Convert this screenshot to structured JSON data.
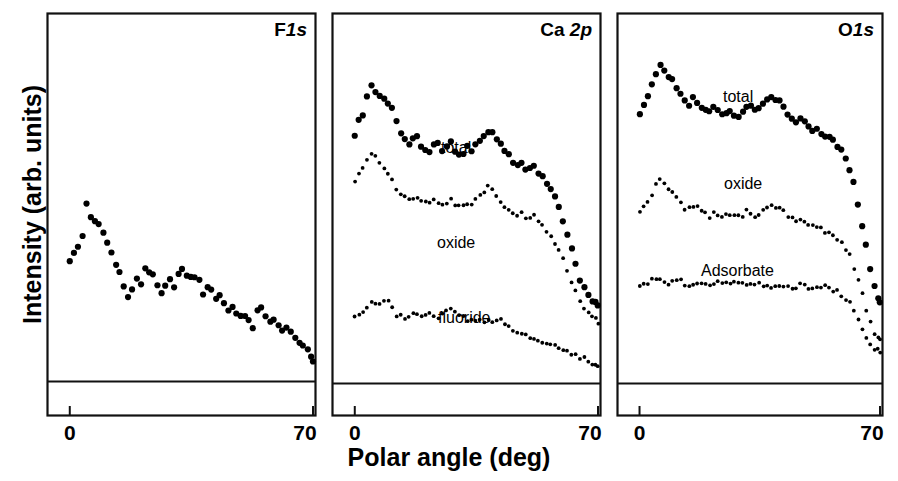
{
  "figure": {
    "xlabel": "Polar angle (deg)",
    "ylabel": "Intensity (arb. units)",
    "tick_left": "0",
    "tick_right": "70"
  },
  "panels": [
    {
      "id": "f1s",
      "title_main": "F",
      "title_ital": "1s",
      "series_labels": []
    },
    {
      "id": "ca2p",
      "title_main": "Ca ",
      "title_ital": "2p",
      "series_labels": [
        "total",
        "oxide",
        "fluoride"
      ]
    },
    {
      "id": "o1s",
      "title_main": "O",
      "title_ital": "1s",
      "series_labels": [
        "total",
        "oxide",
        "Adsorbate"
      ]
    }
  ],
  "chart_data": {
    "type": "scatter",
    "title": "",
    "xlabel": "Polar angle (deg)",
    "ylabel": "Intensity (arb. units)",
    "xlim": [
      0,
      70
    ],
    "xticks": [
      0,
      70
    ],
    "xticklabels": [
      "0",
      "70"
    ],
    "yticks": [],
    "grid": false,
    "legend": "inline-annotations",
    "marker_color": "#000000",
    "panels": [
      {
        "name": "F 1s",
        "baseline_level": 0.06,
        "series": [
          {
            "name": "F1s",
            "label": "",
            "marker": "large-dot",
            "x": [
              0.0,
              1.2,
              2.4,
              3.6,
              4.8,
              6.0,
              7.2,
              8.4,
              9.6,
              10.8,
              12.0,
              13.2,
              14.4,
              15.6,
              16.8,
              18.0,
              19.2,
              20.4,
              21.6,
              22.8,
              24.0,
              25.2,
              26.4,
              27.6,
              28.8,
              30.0,
              31.2,
              32.4,
              33.6,
              34.8,
              36.0,
              37.2,
              38.4,
              39.6,
              40.8,
              42.0,
              43.2,
              44.4,
              45.6,
              46.8,
              48.0,
              49.2,
              50.4,
              51.6,
              52.8,
              54.0,
              55.2,
              56.4,
              57.6,
              58.8,
              60.0,
              61.2,
              62.4,
              63.6,
              64.8,
              66.0,
              67.2,
              68.4,
              69.4,
              70.0
            ],
            "y": [
              0.4,
              0.42,
              0.43,
              0.47,
              0.56,
              0.52,
              0.51,
              0.49,
              0.47,
              0.44,
              0.42,
              0.38,
              0.36,
              0.33,
              0.3,
              0.32,
              0.34,
              0.33,
              0.38,
              0.365,
              0.35,
              0.33,
              0.31,
              0.32,
              0.34,
              0.325,
              0.355,
              0.37,
              0.355,
              0.345,
              0.35,
              0.34,
              0.3,
              0.32,
              0.31,
              0.29,
              0.295,
              0.28,
              0.26,
              0.265,
              0.25,
              0.245,
              0.24,
              0.225,
              0.205,
              0.25,
              0.26,
              0.235,
              0.225,
              0.23,
              0.215,
              0.2,
              0.205,
              0.195,
              0.18,
              0.17,
              0.16,
              0.15,
              0.13,
              0.12
            ]
          }
        ]
      },
      {
        "name": "Ca 2p",
        "baseline_level": 0.06,
        "series": [
          {
            "name": "total",
            "label": "total",
            "marker": "large-dot",
            "x": [
              0.0,
              1.2,
              2.4,
              3.6,
              4.8,
              6.0,
              7.2,
              8.4,
              9.6,
              10.8,
              12.0,
              13.2,
              14.4,
              15.6,
              16.8,
              18.0,
              19.2,
              20.4,
              21.6,
              22.8,
              24.0,
              25.2,
              26.4,
              27.6,
              28.8,
              30.0,
              31.2,
              32.4,
              33.6,
              34.8,
              36.0,
              37.2,
              38.4,
              39.6,
              40.8,
              42.0,
              43.2,
              44.4,
              45.6,
              46.8,
              48.0,
              49.2,
              50.4,
              51.6,
              52.8,
              54.0,
              55.2,
              56.4,
              57.6,
              58.8,
              60.0,
              61.2,
              62.4,
              63.6,
              64.8,
              66.0,
              67.2,
              68.4,
              69.4,
              70.0
            ],
            "y": [
              0.74,
              0.79,
              0.8,
              0.85,
              0.88,
              0.87,
              0.855,
              0.84,
              0.835,
              0.82,
              0.79,
              0.75,
              0.73,
              0.72,
              0.735,
              0.74,
              0.71,
              0.7,
              0.705,
              0.715,
              0.72,
              0.705,
              0.72,
              0.73,
              0.7,
              0.69,
              0.7,
              0.71,
              0.705,
              0.72,
              0.73,
              0.74,
              0.75,
              0.755,
              0.74,
              0.72,
              0.7,
              0.69,
              0.67,
              0.66,
              0.665,
              0.65,
              0.655,
              0.66,
              0.64,
              0.63,
              0.61,
              0.6,
              0.57,
              0.54,
              0.51,
              0.47,
              0.43,
              0.39,
              0.35,
              0.32,
              0.3,
              0.285,
              0.28,
              0.275
            ]
          },
          {
            "name": "oxide",
            "label": "oxide",
            "marker": "small-dot",
            "x": [
              0.0,
              1.2,
              2.4,
              3.6,
              4.8,
              6.0,
              7.2,
              8.4,
              9.6,
              10.8,
              12.0,
              13.2,
              14.4,
              15.6,
              16.8,
              18.0,
              19.2,
              20.4,
              21.6,
              22.8,
              24.0,
              25.2,
              26.4,
              27.6,
              28.8,
              30.0,
              31.2,
              32.4,
              33.6,
              34.8,
              36.0,
              37.2,
              38.4,
              39.6,
              40.8,
              42.0,
              43.2,
              44.4,
              45.6,
              46.8,
              48.0,
              49.2,
              50.4,
              51.6,
              52.8,
              54.0,
              55.2,
              56.4,
              57.6,
              58.8,
              60.0,
              61.2,
              62.4,
              63.6,
              64.8,
              66.0,
              67.2,
              68.4,
              69.4,
              70.0
            ],
            "y": [
              0.62,
              0.64,
              0.65,
              0.68,
              0.69,
              0.685,
              0.67,
              0.66,
              0.64,
              0.62,
              0.6,
              0.58,
              0.57,
              0.565,
              0.575,
              0.57,
              0.56,
              0.555,
              0.56,
              0.565,
              0.555,
              0.55,
              0.56,
              0.565,
              0.555,
              0.545,
              0.55,
              0.555,
              0.56,
              0.57,
              0.58,
              0.59,
              0.6,
              0.595,
              0.58,
              0.565,
              0.55,
              0.54,
              0.53,
              0.525,
              0.53,
              0.52,
              0.515,
              0.52,
              0.505,
              0.495,
              0.48,
              0.47,
              0.45,
              0.425,
              0.4,
              0.37,
              0.34,
              0.31,
              0.285,
              0.265,
              0.25,
              0.24,
              0.235,
              0.23
            ]
          },
          {
            "name": "fluoride",
            "label": "fluoride",
            "marker": "small-dot",
            "x": [
              0.0,
              1.2,
              2.4,
              3.6,
              4.8,
              6.0,
              7.2,
              8.4,
              9.6,
              10.8,
              12.0,
              13.2,
              14.4,
              15.6,
              16.8,
              18.0,
              19.2,
              20.4,
              21.6,
              22.8,
              24.0,
              25.2,
              26.4,
              27.6,
              28.8,
              30.0,
              31.2,
              32.4,
              33.6,
              34.8,
              36.0,
              37.2,
              38.4,
              39.6,
              40.8,
              42.0,
              43.2,
              44.4,
              45.6,
              46.8,
              48.0,
              49.2,
              50.4,
              51.6,
              52.8,
              54.0,
              55.2,
              56.4,
              57.6,
              58.8,
              60.0,
              61.2,
              62.4,
              63.6,
              64.8,
              66.0,
              67.2,
              68.4,
              69.4,
              70.0
            ],
            "y": [
              0.25,
              0.255,
              0.262,
              0.275,
              0.285,
              0.282,
              0.28,
              0.283,
              0.281,
              0.268,
              0.25,
              0.245,
              0.24,
              0.248,
              0.255,
              0.25,
              0.245,
              0.252,
              0.248,
              0.24,
              0.245,
              0.252,
              0.258,
              0.262,
              0.255,
              0.248,
              0.24,
              0.235,
              0.232,
              0.23,
              0.235,
              0.232,
              0.228,
              0.235,
              0.24,
              0.232,
              0.225,
              0.218,
              0.21,
              0.205,
              0.198,
              0.19,
              0.185,
              0.18,
              0.175,
              0.172,
              0.17,
              0.168,
              0.16,
              0.155,
              0.15,
              0.145,
              0.14,
              0.135,
              0.13,
              0.125,
              0.12,
              0.112,
              0.105,
              0.1
            ]
          }
        ]
      },
      {
        "name": "O 1s",
        "baseline_level": 0.06,
        "series": [
          {
            "name": "total",
            "label": "total",
            "marker": "large-dot",
            "x": [
              0.0,
              1.2,
              2.4,
              3.6,
              4.8,
              6.0,
              7.2,
              8.4,
              9.6,
              10.8,
              12.0,
              13.2,
              14.4,
              15.6,
              16.8,
              18.0,
              19.2,
              20.4,
              21.6,
              22.8,
              24.0,
              25.2,
              26.4,
              27.6,
              28.8,
              30.0,
              31.2,
              32.4,
              33.6,
              34.8,
              36.0,
              37.2,
              38.4,
              39.6,
              40.8,
              42.0,
              43.2,
              44.4,
              45.6,
              46.8,
              48.0,
              49.2,
              50.4,
              51.6,
              52.8,
              54.0,
              55.2,
              56.4,
              57.6,
              58.8,
              60.0,
              61.2,
              62.4,
              63.6,
              64.8,
              66.0,
              67.2,
              68.4,
              69.4,
              70.0
            ],
            "y": [
              0.8,
              0.83,
              0.85,
              0.88,
              0.92,
              0.935,
              0.93,
              0.91,
              0.895,
              0.88,
              0.86,
              0.84,
              0.83,
              0.845,
              0.84,
              0.825,
              0.815,
              0.805,
              0.82,
              0.81,
              0.805,
              0.81,
              0.815,
              0.805,
              0.8,
              0.81,
              0.825,
              0.82,
              0.81,
              0.815,
              0.83,
              0.845,
              0.85,
              0.845,
              0.835,
              0.82,
              0.805,
              0.79,
              0.78,
              0.79,
              0.785,
              0.77,
              0.76,
              0.765,
              0.755,
              0.745,
              0.74,
              0.73,
              0.715,
              0.7,
              0.68,
              0.65,
              0.61,
              0.56,
              0.5,
              0.44,
              0.38,
              0.33,
              0.3,
              0.285
            ]
          },
          {
            "name": "oxide",
            "label": "oxide",
            "marker": "small-dot",
            "x": [
              0.0,
              1.2,
              2.4,
              3.6,
              4.8,
              6.0,
              7.2,
              8.4,
              9.6,
              10.8,
              12.0,
              13.2,
              14.4,
              15.6,
              16.8,
              18.0,
              19.2,
              20.4,
              21.6,
              22.8,
              24.0,
              25.2,
              26.4,
              27.6,
              28.8,
              30.0,
              31.2,
              32.4,
              33.6,
              34.8,
              36.0,
              37.2,
              38.4,
              39.6,
              40.8,
              42.0,
              43.2,
              44.4,
              45.6,
              46.8,
              48.0,
              49.2,
              50.4,
              51.6,
              52.8,
              54.0,
              55.2,
              56.4,
              57.6,
              58.8,
              60.0,
              61.2,
              62.4,
              63.6,
              64.8,
              66.0,
              67.2,
              68.4,
              69.4,
              70.0
            ],
            "y": [
              0.53,
              0.545,
              0.555,
              0.575,
              0.605,
              0.62,
              0.615,
              0.6,
              0.585,
              0.57,
              0.555,
              0.545,
              0.54,
              0.55,
              0.545,
              0.535,
              0.528,
              0.522,
              0.532,
              0.525,
              0.52,
              0.525,
              0.53,
              0.522,
              0.518,
              0.525,
              0.535,
              0.53,
              0.522,
              0.528,
              0.54,
              0.55,
              0.555,
              0.55,
              0.542,
              0.532,
              0.522,
              0.512,
              0.505,
              0.512,
              0.508,
              0.498,
              0.49,
              0.495,
              0.488,
              0.48,
              0.475,
              0.468,
              0.458,
              0.448,
              0.432,
              0.41,
              0.38,
              0.345,
              0.305,
              0.265,
              0.228,
              0.2,
              0.185,
              0.175
            ]
          },
          {
            "name": "Adsorbate",
            "label": "Adsorbate",
            "marker": "small-dot",
            "x": [
              0.0,
              1.2,
              2.4,
              3.6,
              4.8,
              6.0,
              7.2,
              8.4,
              9.6,
              10.8,
              12.0,
              13.2,
              14.4,
              15.6,
              16.8,
              18.0,
              19.2,
              20.4,
              21.6,
              22.8,
              24.0,
              25.2,
              26.4,
              27.6,
              28.8,
              30.0,
              31.2,
              32.4,
              33.6,
              34.8,
              36.0,
              37.2,
              38.4,
              39.6,
              40.8,
              42.0,
              43.2,
              44.4,
              45.6,
              46.8,
              48.0,
              49.2,
              50.4,
              51.6,
              52.8,
              54.0,
              55.2,
              56.4,
              57.6,
              58.8,
              60.0,
              61.2,
              62.4,
              63.6,
              64.8,
              66.0,
              67.2,
              68.4,
              69.4,
              70.0
            ],
            "y": [
              0.33,
              0.335,
              0.338,
              0.342,
              0.348,
              0.345,
              0.34,
              0.338,
              0.342,
              0.345,
              0.34,
              0.336,
              0.332,
              0.338,
              0.342,
              0.338,
              0.335,
              0.332,
              0.336,
              0.34,
              0.336,
              0.332,
              0.33,
              0.334,
              0.338,
              0.334,
              0.33,
              0.328,
              0.332,
              0.336,
              0.332,
              0.328,
              0.326,
              0.33,
              0.334,
              0.33,
              0.326,
              0.324,
              0.328,
              0.332,
              0.328,
              0.324,
              0.322,
              0.326,
              0.33,
              0.326,
              0.322,
              0.318,
              0.312,
              0.305,
              0.295,
              0.28,
              0.262,
              0.24,
              0.215,
              0.19,
              0.17,
              0.155,
              0.148,
              0.145
            ]
          }
        ]
      }
    ]
  }
}
